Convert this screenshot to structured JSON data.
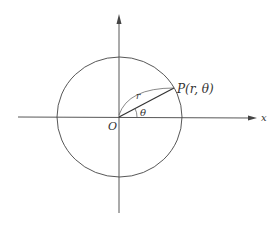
{
  "diagram": {
    "type": "polar-coordinates",
    "colors": {
      "stroke": "#444444",
      "background": "#ffffff",
      "text": "#333333"
    },
    "labels": {
      "origin": "O",
      "x_axis": "x",
      "point": "P(r, θ)",
      "radius": "r",
      "angle": "θ"
    }
  }
}
